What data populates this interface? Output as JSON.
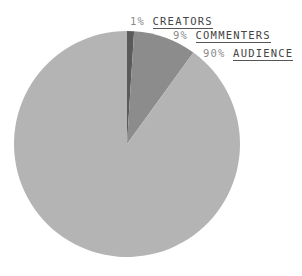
{
  "chart_data": {
    "type": "pie",
    "title": "",
    "categories": [
      "CREATORS",
      "COMMENTERS",
      "AUDIENCE"
    ],
    "values": [
      1,
      9,
      90
    ],
    "labels": [
      {
        "pct": "1%",
        "name": "CREATORS"
      },
      {
        "pct": "9%",
        "name": "COMMENTERS"
      },
      {
        "pct": "90%",
        "name": "AUDIENCE"
      }
    ],
    "colors": [
      "#5a5a5a",
      "#8c8c8c",
      "#b4b4b4"
    ],
    "start_angle": "12 o'clock, clockwise",
    "legend_position": "top-right annotations"
  }
}
